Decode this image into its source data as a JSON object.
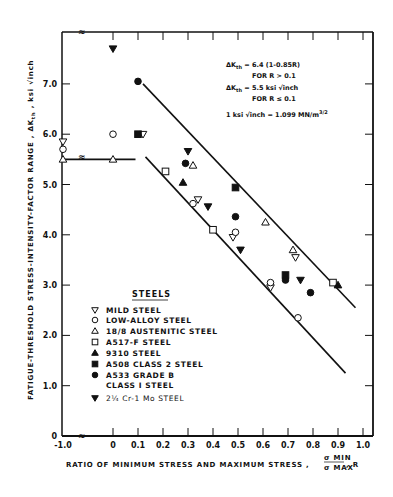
{
  "chart_data": {
    "type": "scatter",
    "title": "",
    "xlabel": "RATIO OF MINIMUM STRESS AND MAXIMUM STRESS , σMIN/σMAX , R",
    "xlabel_main": "RATIO OF MINIMUM STRESS AND MAXIMUM STRESS ,",
    "xlabel_frac_num": "σ MIN",
    "xlabel_frac_den": "σ MAX",
    "xlabel_suffix": ", R",
    "ylabel": "FATIGUE-THRESHOLD STRESS-INTENSITY-FACTOR RANGE , ΔKth , ksi √inch",
    "x_ticks": [
      "-1.0",
      "0",
      "0.1",
      "0.2",
      "0.3",
      "0.4",
      "0.5",
      "0.6",
      "0.7",
      "0.8",
      "0.9",
      "1.0"
    ],
    "y_ticks": [
      "0",
      "1.0",
      "2.0",
      "3.0",
      "4.0",
      "5.0",
      "6.0",
      "7.0"
    ],
    "xlim": [
      -1.0,
      1.0
    ],
    "ylim": [
      0,
      8.0
    ],
    "axis_break": "between -1.0 and 0 on x axis",
    "grid": false,
    "annotations": [
      "ΔKth = 6.4 (1-0.85R)",
      "FOR R > 0.1",
      "ΔKth = 5.5 ksi √inch",
      "FOR R ≤ 0.1",
      "1 ksi √inch = 1.099 MN/m3/2"
    ],
    "legend": {
      "title": "STEELS",
      "position": "lower-left inside plot",
      "entries": [
        {
          "marker": "triangle-down-open",
          "label": "MILD STEEL"
        },
        {
          "marker": "circle-open",
          "label": "LOW-ALLOY STEEL"
        },
        {
          "marker": "triangle-up-open",
          "label": "18/8 AUSTENITIC STEEL"
        },
        {
          "marker": "square-open",
          "label": "A517-F STEEL"
        },
        {
          "marker": "triangle-up-filled",
          "label": "9310 STEEL"
        },
        {
          "marker": "square-filled",
          "label": "A508 CLASS 2 STEEL"
        },
        {
          "marker": "circle-filled",
          "label": "A533 GRADE B CLASS I STEEL"
        },
        {
          "marker": "triangle-down-filled",
          "label": "2¼ Cr-1 Mo STEEL"
        }
      ]
    },
    "lines": [
      {
        "name": "upper-band",
        "points": [
          [
            0.12,
            7.0
          ],
          [
            0.97,
            2.55
          ]
        ]
      },
      {
        "name": "lower-band",
        "points": [
          [
            0.13,
            5.55
          ],
          [
            0.93,
            1.25
          ]
        ]
      },
      {
        "name": "plateau",
        "points": [
          [
            -1.0,
            5.5
          ],
          [
            0.09,
            5.5
          ]
        ]
      }
    ],
    "series": [
      {
        "name": "MILD STEEL",
        "marker": "triangle-down-open",
        "points": [
          [
            -1.0,
            5.85
          ],
          [
            0.12,
            6.0
          ],
          [
            0.34,
            4.7
          ],
          [
            0.48,
            3.95
          ],
          [
            0.63,
            2.95
          ],
          [
            0.73,
            3.55
          ]
        ]
      },
      {
        "name": "LOW-ALLOY STEEL",
        "marker": "circle-open",
        "points": [
          [
            -1.0,
            5.7
          ],
          [
            0.0,
            6.0
          ],
          [
            0.32,
            4.62
          ],
          [
            0.49,
            4.05
          ],
          [
            0.63,
            3.05
          ],
          [
            0.74,
            2.35
          ]
        ]
      },
      {
        "name": "18/8 AUSTENITIC STEEL",
        "marker": "triangle-up-open",
        "points": [
          [
            -1.0,
            5.5
          ],
          [
            0.0,
            5.5
          ],
          [
            0.32,
            5.38
          ],
          [
            0.61,
            4.25
          ],
          [
            0.72,
            3.7
          ]
        ]
      },
      {
        "name": "A517-F STEEL",
        "marker": "square-open",
        "points": [
          [
            0.21,
            5.26
          ],
          [
            0.4,
            4.1
          ],
          [
            0.88,
            3.05
          ]
        ]
      },
      {
        "name": "9310 STEEL",
        "marker": "triangle-up-filled",
        "points": [
          [
            0.28,
            5.04
          ],
          [
            0.9,
            3.0
          ]
        ]
      },
      {
        "name": "A508 CLASS 2 STEEL",
        "marker": "square-filled",
        "points": [
          [
            0.1,
            6.0
          ],
          [
            0.49,
            4.94
          ],
          [
            0.69,
            3.2
          ]
        ]
      },
      {
        "name": "A533 GRADE B CLASS I STEEL",
        "marker": "circle-filled",
        "points": [
          [
            0.1,
            7.05
          ],
          [
            0.29,
            5.42
          ],
          [
            0.49,
            4.36
          ],
          [
            0.69,
            3.1
          ],
          [
            0.79,
            2.85
          ]
        ]
      },
      {
        "name": "2¼ Cr-1 Mo STEEL",
        "marker": "triangle-down-filled",
        "points": [
          [
            0.0,
            7.7
          ],
          [
            0.3,
            5.66
          ],
          [
            0.38,
            4.56
          ],
          [
            0.51,
            3.7
          ],
          [
            0.75,
            3.1
          ]
        ]
      }
    ]
  },
  "text": {
    "ylabel": "FATIGUE-THRESHOLD STRESS-INTENSITY-FACTOR RANGE , ΔK",
    "ylabel_sub": "th",
    "ylabel_unit": " , ksi √inch",
    "anno1": "ΔK",
    "anno1_sub": "th",
    "anno1_rest": " = 6.4 (1-0.85R)",
    "anno2": "FOR R > 0.1",
    "anno3": "ΔK",
    "anno3_sub": "th",
    "anno3_rest": " = 5.5 ksi √inch",
    "anno4": "FOR R ≤ 0.1",
    "anno5": "1 ksi √inch = 1.099 MN/m",
    "anno5_sup": "3/2",
    "legend_title": "STEELS",
    "legend_labels": [
      "MILD STEEL",
      "LOW-ALLOY STEEL",
      "18/8 AUSTENITIC STEEL",
      "A517-F STEEL",
      "9310 STEEL",
      "A508 CLASS 2 STEEL",
      "A533 GRADE B",
      "CLASS I STEEL",
      "2¼ Cr-1 Mo STEEL"
    ]
  }
}
